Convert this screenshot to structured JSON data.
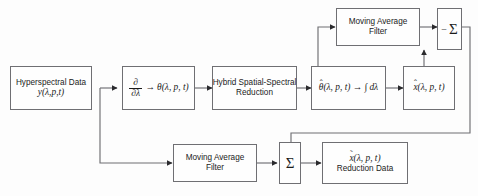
{
  "diagram": {
    "background_color": "#fdfdfd",
    "line_color": "#6f6f73",
    "text_color": "#1b1b1b",
    "blocks": {
      "input": {
        "line1": "Hyperspectral Data",
        "line2": "y(λ,p,t)"
      },
      "derivative": {
        "numerator": "∂",
        "denominator": "∂λ",
        "arrow": "→",
        "result": "θ(λ, p, t)"
      },
      "hybrid_reduction": {
        "line1": "Hybrid Spatial-Spectral",
        "line2": "Reduction"
      },
      "integration": {
        "source_base": "θ",
        "source_accent": "ˆ",
        "source_args": "(λ, p, t)",
        "arrow": "→",
        "integral": "∫ dλ"
      },
      "estimate": {
        "base": "x",
        "accent": "ˆ",
        "args": "(λ, p, t)"
      },
      "moving_average_top": {
        "line1": "Moving Average",
        "line2": "Filter"
      },
      "moving_average_bottom": {
        "line1": "Moving Average",
        "line2": "Filter"
      },
      "subtract_sum": {
        "sign": "−",
        "symbol": "Σ"
      },
      "add_sum": {
        "symbol": "Σ"
      },
      "output": {
        "base": "x",
        "accent": "˜",
        "args": "(λ, p, t)",
        "line2": "Reduction  Data"
      }
    }
  }
}
